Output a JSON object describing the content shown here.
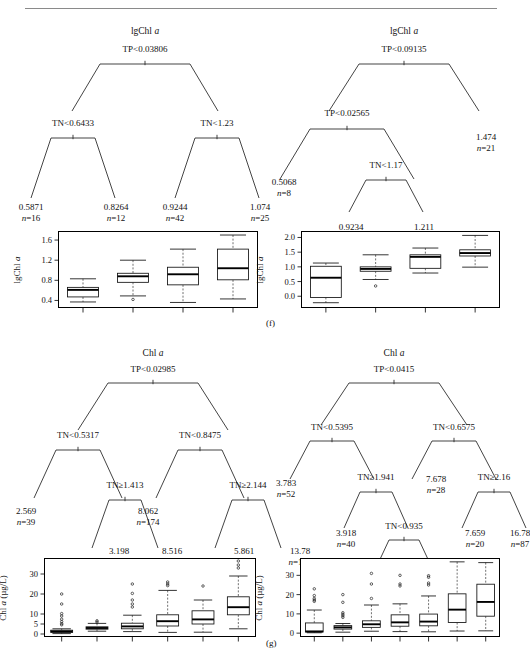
{
  "figure": {
    "panels": [
      {
        "letter": "(f)",
        "response": "lgChl a",
        "trees": [
          {
            "id": "tree-f-left",
            "title_prefix": "lgChl",
            "title_italic": "a",
            "root": "TP<0.03806",
            "internal_nodes": [
              "TN<0.6433",
              "TN<1.23"
            ],
            "leaves": [
              {
                "value": "0.5871",
                "n": "n=16"
              },
              {
                "value": "0.8264",
                "n": "n=12"
              },
              {
                "value": "0.9244",
                "n": "n=42"
              },
              {
                "value": "1.074",
                "n": "n=25"
              }
            ]
          },
          {
            "id": "tree-f-right",
            "title_prefix": "lgChl",
            "title_italic": "a",
            "root": "TP<0.09135",
            "internal_nodes": [
              "TP<0.02565",
              "TN<1.17"
            ],
            "leaves": [
              {
                "value": "0.5068",
                "n": "n=8"
              },
              {
                "value": "0.9234",
                "n": "n=20"
              },
              {
                "value": "1.211",
                "n": "n=7"
              },
              {
                "value": "1.474",
                "n": "n=21"
              }
            ]
          }
        ]
      },
      {
        "letter": "(g)",
        "response": "Chl a (µg/L)",
        "trees": [
          {
            "id": "tree-g-left",
            "title_prefix": "Chl",
            "title_italic": "a",
            "root": "TP<0.02985",
            "internal_nodes": [
              "TN<0.5317",
              "TN<0.8475",
              "TN≥1.413",
              "TN≥2.144"
            ],
            "leaves": [
              {
                "value": "2.569",
                "n": "n=39"
              },
              {
                "value": "3.198",
                "n": "n=42"
              },
              {
                "value": "8.516",
                "n": "n=64"
              },
              {
                "value": "8.062",
                "n": "n=174"
              },
              {
                "value": "5.861",
                "n": "n=35"
              },
              {
                "value": "13.78",
                "n": "n=103"
              }
            ]
          },
          {
            "id": "tree-g-right",
            "title_prefix": "Chl",
            "title_italic": "a",
            "root": "TP<0.0415",
            "internal_nodes": [
              "TN<0.5395",
              "TN<0.6575",
              "TN≥1.941",
              "TN≥2.16",
              "TN<0.935"
            ],
            "leaves": [
              {
                "value": "3.783",
                "n": "n=52"
              },
              {
                "value": "3.918",
                "n": "n=40"
              },
              {
                "value": "7.747",
                "n": "n=114"
              },
              {
                "value": "13.67",
                "n": "n=58"
              },
              {
                "value": "7.678",
                "n": "n=28"
              },
              {
                "value": "7.659",
                "n": "n=20"
              },
              {
                "value": "16.78",
                "n": "n=87"
              }
            ]
          }
        ]
      }
    ]
  },
  "chart_data": [
    {
      "id": "boxplot-f-left",
      "type": "box",
      "title": "",
      "xlabel": "",
      "ylabel": "lgChl a",
      "ylabel_prefix": "lgChl",
      "ylabel_italic": "a",
      "ylim": [
        0.25,
        1.78
      ],
      "yticks": [
        0.4,
        0.8,
        1.2,
        1.6
      ],
      "ytick_labels": [
        "0.4",
        "0.8",
        "1.2",
        "1.6"
      ],
      "grid": false,
      "legend": false,
      "categories": [
        "1",
        "2",
        "3",
        "4"
      ],
      "boxes": [
        {
          "category": "1",
          "whisker_low": 0.37,
          "q1": 0.47,
          "median": 0.61,
          "q3": 0.66,
          "whisker_high": 0.83,
          "outliers": []
        },
        {
          "category": "2",
          "whisker_low": 0.49,
          "q1": 0.76,
          "median": 0.88,
          "q3": 0.94,
          "whisker_high": 1.2,
          "outliers": [
            0.42
          ]
        },
        {
          "category": "3",
          "whisker_low": 0.36,
          "q1": 0.71,
          "median": 0.92,
          "q3": 1.06,
          "whisker_high": 1.42,
          "outliers": []
        },
        {
          "category": "4",
          "whisker_low": 0.43,
          "q1": 0.81,
          "median": 1.04,
          "q3": 1.42,
          "whisker_high": 1.7,
          "outliers": []
        }
      ]
    },
    {
      "id": "boxplot-f-right",
      "type": "box",
      "title": "",
      "xlabel": "",
      "ylabel": "lgChl a",
      "ylabel_prefix": "lgChl",
      "ylabel_italic": "a",
      "ylim": [
        -0.4,
        2.22
      ],
      "yticks": [
        0.0,
        0.5,
        1.0,
        1.5,
        2.0
      ],
      "ytick_labels": [
        "0.0",
        "0.5",
        "1.0",
        "1.5",
        "2.0"
      ],
      "grid": false,
      "legend": false,
      "categories": [
        "1",
        "2",
        "3",
        "4"
      ],
      "boxes": [
        {
          "category": "1",
          "whisker_low": -0.22,
          "q1": -0.04,
          "median": 0.63,
          "q3": 1.02,
          "whisker_high": 1.13,
          "outliers": []
        },
        {
          "category": "2",
          "whisker_low": 0.57,
          "q1": 0.85,
          "median": 0.93,
          "q3": 1.0,
          "whisker_high": 1.41,
          "outliers": [
            0.35
          ]
        },
        {
          "category": "3",
          "whisker_low": 0.79,
          "q1": 0.95,
          "median": 1.34,
          "q3": 1.41,
          "whisker_high": 1.64,
          "outliers": []
        },
        {
          "category": "4",
          "whisker_low": 0.99,
          "q1": 1.37,
          "median": 1.47,
          "q3": 1.58,
          "whisker_high": 2.07,
          "outliers": []
        }
      ]
    },
    {
      "id": "boxplot-g-left",
      "type": "box",
      "title": "",
      "xlabel": "",
      "ylabel": "Chl a (µg/L)",
      "ylabel_prefix": "Chl",
      "ylabel_italic": "a",
      "ylabel_suffix": " (µg/L)",
      "ylim": [
        -1.5,
        38
      ],
      "yticks": [
        0,
        5,
        10,
        20,
        30
      ],
      "ytick_labels": [
        "0",
        "5",
        "10",
        "20",
        "30"
      ],
      "grid": false,
      "legend": false,
      "categories": [
        "1",
        "2",
        "3",
        "4",
        "5",
        "6"
      ],
      "boxes": [
        {
          "category": "1",
          "whisker_low": 0.2,
          "q1": 0.8,
          "median": 1.3,
          "q3": 1.9,
          "whisker_high": 2.6,
          "outliers": [
            20.0,
            15.0,
            10.2,
            9.0,
            7.4,
            6.2,
            5.2,
            4.6
          ]
        },
        {
          "category": "2",
          "whisker_low": 1.4,
          "q1": 2.4,
          "median": 3.0,
          "q3": 3.6,
          "whisker_high": 5.3,
          "outliers": [
            6.6,
            6.0
          ]
        },
        {
          "category": "3",
          "whisker_low": 1.2,
          "q1": 2.6,
          "median": 3.8,
          "q3": 5.4,
          "whisker_high": 9.4,
          "outliers": [
            25.0,
            20.3,
            17.0,
            15.0,
            13.5
          ]
        },
        {
          "category": "4",
          "whisker_low": 0.8,
          "q1": 4.0,
          "median": 6.4,
          "q3": 9.6,
          "whisker_high": 21.8,
          "outliers": [
            26.0,
            25.0,
            24.2
          ]
        },
        {
          "category": "5",
          "whisker_low": 0.9,
          "q1": 5.0,
          "median": 7.3,
          "q3": 11.6,
          "whisker_high": 17.0,
          "outliers": [
            24.0
          ]
        },
        {
          "category": "6",
          "whisker_low": 2.6,
          "q1": 9.6,
          "median": 13.4,
          "q3": 18.6,
          "whisker_high": 29.0,
          "outliers": [
            36.5,
            34.5,
            33.0
          ]
        }
      ]
    },
    {
      "id": "boxplot-g-right",
      "type": "box",
      "title": "",
      "xlabel": "",
      "ylabel": "Chl a (µg/L)",
      "ylabel_prefix": "Chl",
      "ylabel_italic": "a",
      "ylabel_suffix": " (µg/L)",
      "ylim": [
        -2.0,
        39
      ],
      "yticks": [
        0,
        10,
        20,
        30
      ],
      "ytick_labels": [
        "0",
        "10",
        "20",
        "30"
      ],
      "grid": false,
      "legend": false,
      "categories": [
        "1",
        "2",
        "3",
        "4",
        "5",
        "6",
        "7"
      ],
      "boxes": [
        {
          "category": "1",
          "whisker_low": 0.2,
          "q1": 0.6,
          "median": 0.9,
          "q3": 5.3,
          "whisker_high": 12.0,
          "outliers": [
            23.0,
            19.5,
            18.0,
            17.2,
            16.5
          ]
        },
        {
          "category": "2",
          "whisker_low": 0.5,
          "q1": 2.1,
          "median": 3.0,
          "q3": 3.9,
          "whisker_high": 5.0,
          "outliers": [
            20.0,
            16.0,
            10.6,
            9.8,
            9.0,
            8.2
          ]
        },
        {
          "category": "3",
          "whisker_low": 1.0,
          "q1": 3.0,
          "median": 4.6,
          "q3": 6.4,
          "whisker_high": 14.6,
          "outliers": [
            31.0,
            25.5,
            18.0
          ]
        },
        {
          "category": "4",
          "whisker_low": 0.8,
          "q1": 3.6,
          "median": 5.6,
          "q3": 9.5,
          "whisker_high": 15.2,
          "outliers": [
            30.0,
            25.5,
            24.5
          ]
        },
        {
          "category": "5",
          "whisker_low": 0.7,
          "q1": 3.8,
          "median": 6.0,
          "q3": 9.9,
          "whisker_high": 19.3,
          "outliers": [
            29.8,
            29.0,
            26.0,
            25.0
          ]
        },
        {
          "category": "6",
          "whisker_low": 1.1,
          "q1": 5.5,
          "median": 12.2,
          "q3": 20.4,
          "whisker_high": 37.0,
          "outliers": []
        },
        {
          "category": "7",
          "whisker_low": 1.2,
          "q1": 8.8,
          "median": 16.2,
          "q3": 25.4,
          "whisker_high": 36.6,
          "outliers": []
        }
      ]
    }
  ]
}
